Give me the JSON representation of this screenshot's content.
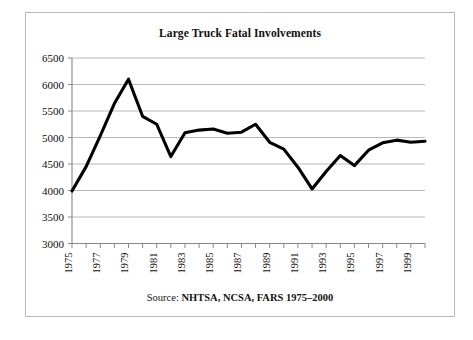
{
  "figure": {
    "title": "Large Truck Fatal Involvements",
    "caption_label": "Source: ",
    "caption_value": "NHTSA, NCSA, FARS 1975–2000"
  },
  "chart_data": {
    "type": "line",
    "title": "Large Truck Fatal Involvements",
    "xlabel": "",
    "ylabel": "",
    "ylim": [
      3000,
      6500
    ],
    "xlim": [
      1975,
      2000
    ],
    "ytick_step": 500,
    "grid": true,
    "legend": "none",
    "annotation": "Source: NHTSA, NCSA, FARS 1975–2000",
    "ytick_labels": [
      "3000",
      "3500",
      "4000",
      "4500",
      "5000",
      "5500",
      "6000",
      "6500"
    ],
    "ytick_values": [
      3000,
      3500,
      4000,
      4500,
      5000,
      5500,
      6000,
      6500
    ],
    "xtick_labels": [
      "1975",
      "1977",
      "1979",
      "1981",
      "1983",
      "1985",
      "1987",
      "1989",
      "1991",
      "1993",
      "1995",
      "1997",
      "1999"
    ],
    "xtick_label_values": [
      1975,
      1977,
      1979,
      1981,
      1983,
      1985,
      1987,
      1989,
      1991,
      1993,
      1995,
      1997,
      1999
    ],
    "x": [
      1975,
      1976,
      1977,
      1978,
      1979,
      1980,
      1981,
      1982,
      1983,
      1984,
      1985,
      1986,
      1987,
      1988,
      1989,
      1990,
      1991,
      1992,
      1993,
      1994,
      1995,
      1996,
      1997,
      1998,
      1999,
      2000
    ],
    "values": [
      3990,
      4450,
      5030,
      5640,
      6100,
      5400,
      5250,
      4640,
      5090,
      5140,
      5160,
      5080,
      5100,
      5250,
      4910,
      4780,
      4440,
      4030,
      4360,
      4660,
      4470,
      4760,
      4900,
      4950,
      4910,
      4930
    ],
    "series": [
      {
        "name": "Large truck fatal involvements",
        "color": "#000000",
        "values": [
          3990,
          4450,
          5030,
          5640,
          6100,
          5400,
          5250,
          4640,
          5090,
          5140,
          5160,
          5080,
          5100,
          5250,
          4910,
          4780,
          4440,
          4030,
          4360,
          4660,
          4470,
          4760,
          4900,
          4950,
          4910,
          4930
        ]
      }
    ]
  }
}
